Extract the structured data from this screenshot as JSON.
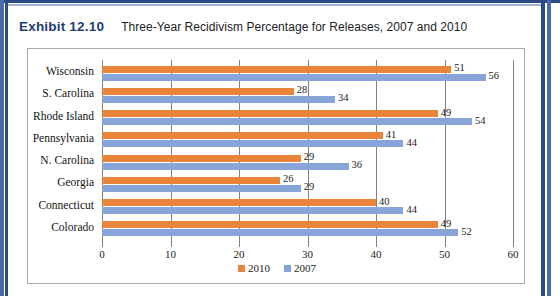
{
  "exhibit": {
    "number": "Exhibit 12.10",
    "title": "Three-Year Recidivism Percentage for Releases, 2007 and 2010"
  },
  "colors": {
    "series_2010": "#E8853A",
    "series_2007": "#87A5D8",
    "exhibit_number": "#1F3C72",
    "gridline": "#808080",
    "frame": "#2B4A8A"
  },
  "chart_data": {
    "type": "bar",
    "orientation": "horizontal",
    "title": "Three-Year Recidivism Percentage for Releases, 2007 and 2010",
    "xlabel": "",
    "ylabel": "",
    "xlim": [
      0,
      60
    ],
    "xticks": [
      0,
      10,
      20,
      30,
      40,
      50,
      60
    ],
    "xtick_labels": [
      "0",
      "10",
      "20",
      "30",
      "40",
      "50",
      "60"
    ],
    "grid": true,
    "legend_position": "bottom",
    "categories": [
      "Colorado",
      "Connecticut",
      "Georgia",
      "N. Carolina",
      "Pennsylvania",
      "Rhode Island",
      "S. Carolina",
      "Wisconsin"
    ],
    "series": [
      {
        "name": "2010",
        "color": "#E8853A",
        "values": [
          49,
          40,
          26,
          29,
          41,
          49,
          28,
          51
        ]
      },
      {
        "name": "2007",
        "color": "#87A5D8",
        "values": [
          52,
          44,
          29,
          36,
          44,
          54,
          34,
          56
        ]
      }
    ],
    "data_labels": {
      "2010": [
        "49",
        "40",
        "26",
        "29",
        "41",
        "49",
        "28",
        "51"
      ],
      "2007": [
        "52",
        "44",
        "29",
        "36",
        "44",
        "54",
        "34",
        "56"
      ]
    }
  },
  "legend": {
    "items": [
      {
        "label": "2010",
        "color": "#E8853A"
      },
      {
        "label": "2007",
        "color": "#87A5D8"
      }
    ]
  }
}
